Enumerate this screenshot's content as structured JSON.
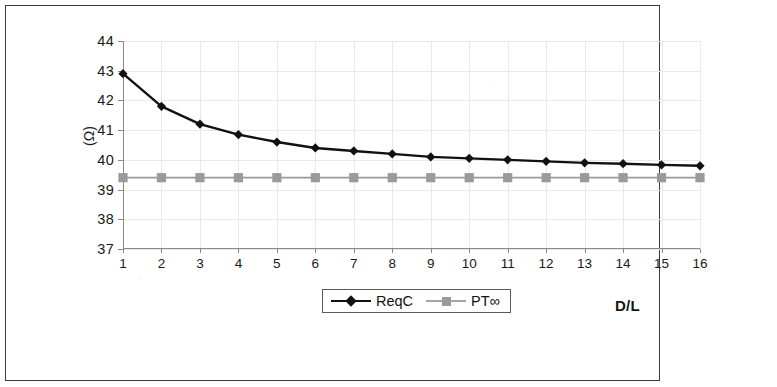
{
  "figure": {
    "y_axis_title": "(Ω)",
    "x_axis_title": "D/L"
  },
  "legend": {
    "entries": [
      {
        "label": "ReqC",
        "color": "#111111",
        "marker": "diamond"
      },
      {
        "label": "PT∞",
        "color": "#9a9a9a",
        "marker": "square"
      }
    ]
  },
  "chart_data": {
    "type": "line",
    "title": "",
    "xlabel": "D/L",
    "ylabel": "(Ω)",
    "xlim": [
      1,
      16
    ],
    "ylim": [
      37,
      44
    ],
    "grid": true,
    "legend_position": "bottom-center",
    "x": [
      1,
      2,
      3,
      4,
      5,
      6,
      7,
      8,
      9,
      10,
      11,
      12,
      13,
      14,
      15,
      16
    ],
    "xticklabels": [
      "1",
      "2",
      "3",
      "4",
      "5",
      "6",
      "7",
      "8",
      "9",
      "10",
      "11",
      "12",
      "13",
      "14",
      "15",
      "16"
    ],
    "yticks": [
      37,
      38,
      39,
      40,
      41,
      42,
      43,
      44
    ],
    "yticklabels": [
      "37",
      "38",
      "39",
      "40",
      "41",
      "42",
      "43",
      "44"
    ],
    "series": [
      {
        "name": "ReqC",
        "color": "#111111",
        "marker": "diamond",
        "values": [
          42.9,
          41.8,
          41.2,
          40.85,
          40.6,
          40.4,
          40.3,
          40.2,
          40.1,
          40.05,
          40.0,
          39.95,
          39.9,
          39.87,
          39.83,
          39.8
        ]
      },
      {
        "name": "PT∞",
        "color": "#9a9a9a",
        "marker": "square",
        "values": [
          39.4,
          39.4,
          39.4,
          39.4,
          39.4,
          39.4,
          39.4,
          39.4,
          39.4,
          39.4,
          39.4,
          39.4,
          39.4,
          39.4,
          39.4,
          39.4
        ]
      }
    ]
  }
}
